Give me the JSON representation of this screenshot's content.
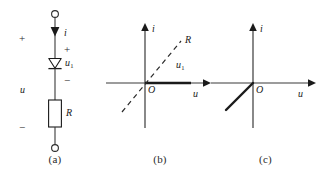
{
  "figure": {
    "panels": [
      {
        "caption": "(a)",
        "type": "circuit",
        "labels": {
          "current": "i",
          "source_voltage": "u",
          "diode_voltage": "u1",
          "resistor": "R",
          "plus_outer": "+",
          "minus_outer": "−",
          "plus_inner": "+",
          "minus_inner": "−"
        },
        "components": [
          "terminal-top",
          "current-arrow",
          "ideal-diode",
          "resistor",
          "terminal-bottom"
        ]
      },
      {
        "caption": "(b)",
        "type": "graph",
        "labels": {
          "y_axis": "i",
          "x_axis": "u",
          "origin": "O",
          "load_line": "R",
          "curve": "u1"
        },
        "curves": [
          {
            "name": "diode-characteristic",
            "style": "solid",
            "quadrant": "positive-u-axis"
          },
          {
            "name": "resistor-load-line",
            "style": "dashed",
            "quadrant": "through-origin"
          }
        ]
      },
      {
        "caption": "(c)",
        "type": "graph",
        "labels": {
          "y_axis": "i",
          "x_axis": "u",
          "origin": "O"
        },
        "curves": [
          {
            "name": "combined-characteristic",
            "style": "solid",
            "quadrant": "third"
          }
        ]
      }
    ]
  },
  "colors": {
    "ink": "#1a1a1a",
    "axis": "#3a3a3a",
    "background": "#ffffff"
  }
}
